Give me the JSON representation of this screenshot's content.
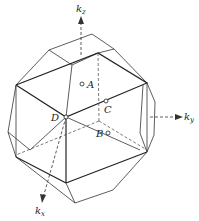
{
  "diagram": {
    "axes": [
      {
        "id": "kz",
        "label": "k",
        "subscript": "z"
      },
      {
        "id": "ky",
        "label": "k",
        "subscript": "y"
      },
      {
        "id": "kx",
        "label": "k",
        "subscript": "x"
      }
    ],
    "points": [
      {
        "id": "A",
        "label": "A"
      },
      {
        "id": "B",
        "label": "B"
      },
      {
        "id": "C",
        "label": "C"
      },
      {
        "id": "D",
        "label": "D"
      }
    ],
    "colors": {
      "line": "#333333",
      "background": "#ffffff"
    }
  }
}
